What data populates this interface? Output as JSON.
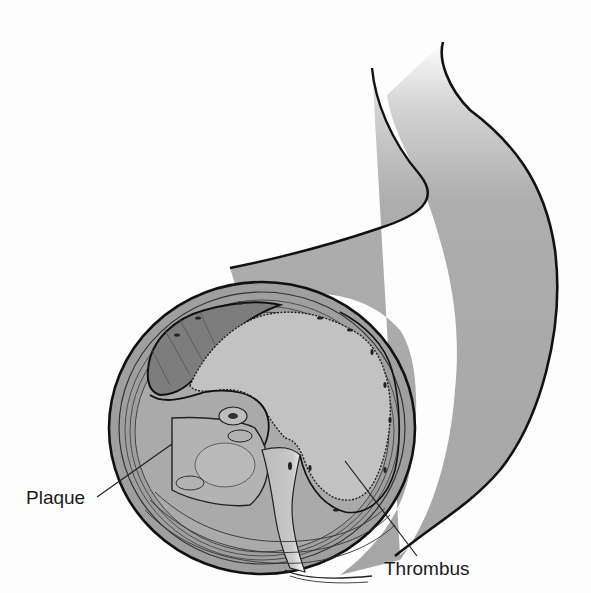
{
  "figure": {
    "labels": [
      {
        "id": "plaque",
        "text": "Plaque"
      },
      {
        "id": "thrombus",
        "text": "Thrombus"
      }
    ],
    "colors": {
      "vessel_fill": "#a9a9a9",
      "vessel_wall": "#9c9c9c",
      "outline": "#111111",
      "thrombus_fill": "#bdbdbd",
      "lumen_dark": "#7a7a7a",
      "plaque_fill": "#b0b0b0",
      "background": "#fdfdfd"
    }
  }
}
